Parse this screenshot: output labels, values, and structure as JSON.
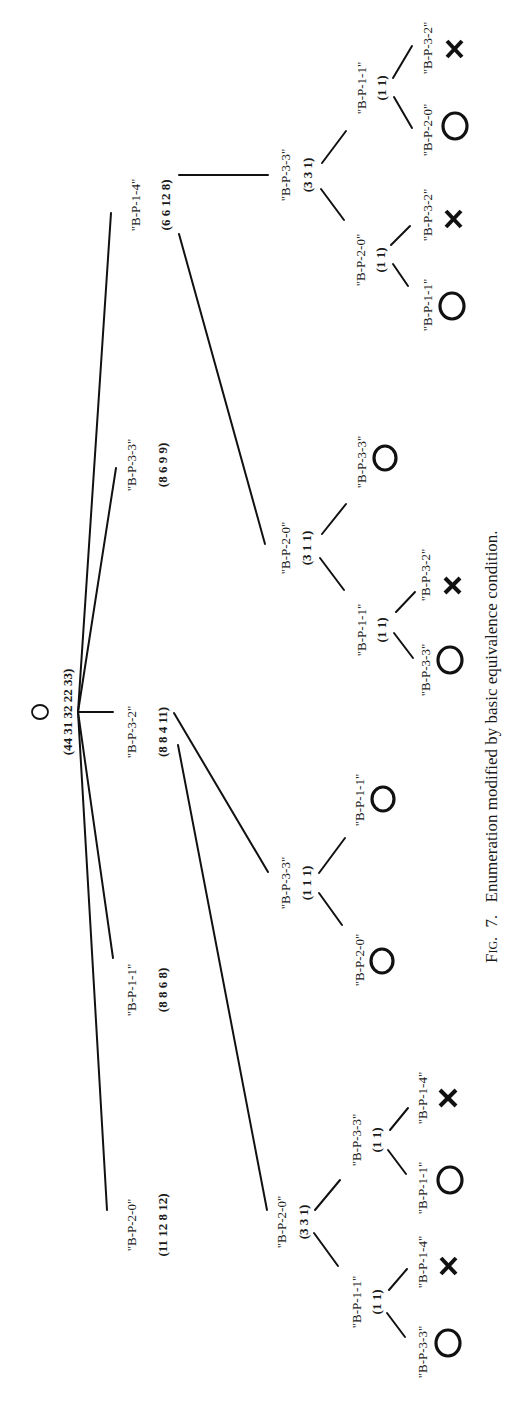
{
  "caption": {
    "prefix": "Fig.",
    "number": "7.",
    "text": "Enumeration modified by basic equivalence condition.",
    "full": "Fig. 7.  Enumeration modified by basic equivalence condition."
  },
  "symbols": {
    "success": "O",
    "failure": "X"
  },
  "tree": {
    "root": {
      "mark": "O",
      "counts": "(44 31 32 22 33)",
      "children": [
        {
          "label": "\"B-P-2-0\"",
          "counts": "(11 12 8 12)",
          "children": [
            {
              "label": "\"B-P-2-0\"",
              "counts": "(3 3 1)",
              "children": [
                {
                  "label": "\"B-P-1-1\"",
                  "counts": "(1 1)",
                  "children": [
                    {
                      "label": "\"B-P-3-3\"",
                      "result": "O"
                    },
                    {
                      "label": "\"B-P-1-4\"",
                      "result": "X"
                    }
                  ]
                },
                {
                  "label": "\"B-P-3-3\"",
                  "counts": "(1 1)",
                  "children": [
                    {
                      "label": "\"B-P-1-1\"",
                      "result": "O"
                    },
                    {
                      "label": "\"B-P-1-4\"",
                      "result": "X"
                    }
                  ]
                }
              ]
            }
          ]
        },
        {
          "label": "\"B-P-1-1\"",
          "counts": "(8 8 6 8)",
          "children": []
        },
        {
          "label": "\"B-P-3-2\"",
          "counts": "(8 8 4 11)",
          "children": [
            {
              "label": "\"B-P-3-3\"",
              "counts": "(1 1 1)",
              "children": [
                {
                  "label": "\"B-P-2-0\"",
                  "result": "O"
                },
                {
                  "label": "\"B-P-1-1\"",
                  "result": "O"
                }
              ]
            }
          ]
        },
        {
          "label": "\"B-P-3-3\"",
          "counts": "(8 6 9 9)",
          "children": []
        },
        {
          "label": "\"B-P-1-4\"",
          "counts": "(6 6 12 8)",
          "children": [
            {
              "label": "\"B-P-2-0\"",
              "counts": "(3 1 1)",
              "children": [
                {
                  "label": "\"B-P-1-1\"",
                  "counts": "(1 1)",
                  "children": [
                    {
                      "label": "\"B-P-3-3\"",
                      "result": "O"
                    },
                    {
                      "label": "\"B-P-3-2\"",
                      "result": "X"
                    }
                  ]
                },
                {
                  "label": "\"B-P-3-3\"",
                  "result": "O"
                }
              ]
            },
            {
              "label": "\"B-P-3-3\"",
              "counts": "(3 3 1)",
              "children": [
                {
                  "label": "\"B-P-2-0\"",
                  "counts": "(1 1)",
                  "children": [
                    {
                      "label": "\"B-P-1-1\"",
                      "result": "O"
                    },
                    {
                      "label": "\"B-P-3-2\"",
                      "result": "X"
                    }
                  ]
                },
                {
                  "label": "\"B-P-1-1\"",
                  "counts": "(1 1)",
                  "children": [
                    {
                      "label": "\"B-P-2-0\"",
                      "result": "O"
                    },
                    {
                      "label": "\"B-P-3-2\"",
                      "result": "X"
                    }
                  ]
                }
              ]
            }
          ]
        }
      ]
    }
  },
  "t": {
    "root_mark": "O",
    "root_counts": "(44 31 32 22 33)",
    "l1_a_label": "\"B-P-2-0\"",
    "l1_a_counts": "(11 12 8 12)",
    "l1_b_label": "\"B-P-1-1\"",
    "l1_b_counts": "(8 8 6 8)",
    "l1_c_label": "\"B-P-3-2\"",
    "l1_c_counts": "(8 8 4 11)",
    "l1_d_label": "\"B-P-3-3\"",
    "l1_d_counts": "(8 6 9 9)",
    "l1_e_label": "\"B-P-1-4\"",
    "l1_e_counts": "(6 6 12 8)",
    "a2_label": "\"B-P-2-0\"",
    "a2_counts": "(3 3 1)",
    "a3x_label": "\"B-P-1-1\"",
    "a3x_counts": "(1 1)",
    "a3y_label": "\"B-P-3-3\"",
    "a3y_counts": "(1 1)",
    "a4_1": "\"B-P-3-3\"",
    "a4_2": "\"B-P-1-4\"",
    "a4_3": "\"B-P-1-1\"",
    "a4_4": "\"B-P-1-4\"",
    "c2_label": "\"B-P-3-3\"",
    "c2_counts": "(1 1 1)",
    "c3_1": "\"B-P-2-0\"",
    "c3_2": "\"B-P-1-1\"",
    "e2a_label": "\"B-P-2-0\"",
    "e2a_counts": "(3 1 1)",
    "e3a_label": "\"B-P-1-1\"",
    "e3a_counts": "(1 1)",
    "e3a_leaf": "\"B-P-3-3\"",
    "e4a_1": "\"B-P-3-3\"",
    "e4a_2": "\"B-P-3-2\"",
    "e2b_label": "\"B-P-3-3\"",
    "e2b_counts": "(3 3 1)",
    "e3b_label": "\"B-P-2-0\"",
    "e3b_counts": "(1 1)",
    "e3c_label": "\"B-P-1-1\"",
    "e3c_counts": "(1 1)",
    "e4b_1": "\"B-P-1-1\"",
    "e4b_2": "\"B-P-3-2\"",
    "e4b_3": "\"B-P-2-0\"",
    "e4b_4": "\"B-P-3-2\"",
    "cap_fig": "Fig.",
    "cap_num": "7.",
    "cap_text": "Enumeration modified by basic equivalence condition."
  }
}
